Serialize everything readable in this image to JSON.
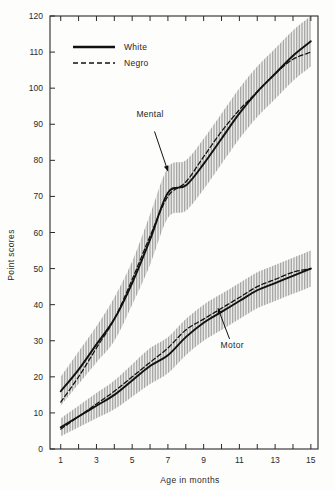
{
  "chart_data": {
    "type": "line",
    "title": "",
    "xlabel": "Age in months",
    "ylabel": "Point scores",
    "xlim": [
      0.4,
      15.4
    ],
    "ylim": [
      0,
      120
    ],
    "ytick_values": [
      0,
      10,
      20,
      30,
      40,
      50,
      60,
      70,
      80,
      90,
      100,
      110,
      120
    ],
    "ytick_labels": [
      "0",
      "10",
      "20",
      "30",
      "40",
      "50",
      "60",
      "70",
      "80",
      "90",
      "100",
      "110",
      "120"
    ],
    "xtick_values": [
      1,
      2,
      3,
      4,
      5,
      6,
      7,
      8,
      9,
      10,
      11,
      12,
      13,
      14,
      15
    ],
    "xtick_labels": [
      "1",
      "",
      "3",
      "",
      "5",
      "",
      "7",
      "",
      "9",
      "",
      "11",
      "",
      "13",
      "",
      "15"
    ],
    "grid": false,
    "legend_position": "upper-left-inside",
    "legend": [
      {
        "name": "White",
        "style": "solid"
      },
      {
        "name": "Negro",
        "style": "dashed"
      }
    ],
    "annotations": [
      {
        "text": "Mental",
        "x": 6.0,
        "y": 92
      },
      {
        "text": "Motor",
        "x": 10.6,
        "y": 28
      }
    ],
    "x": [
      1,
      2,
      3,
      4,
      5,
      6,
      7,
      8,
      9,
      10,
      11,
      12,
      13,
      14,
      15
    ],
    "series": [
      {
        "name": "Mental White",
        "group": "Mental",
        "style": "solid",
        "values": [
          16,
          22,
          29,
          36,
          46,
          58,
          71,
          73,
          79,
          86,
          93,
          99,
          104,
          109,
          113
        ],
        "band_low": [
          12,
          18,
          24,
          30,
          40,
          51,
          64,
          66,
          72,
          79,
          86,
          92,
          97,
          102,
          106
        ],
        "band_high": [
          20,
          27,
          34,
          42,
          52,
          65,
          78,
          80,
          86,
          93,
          100,
          106,
          111,
          116,
          120
        ]
      },
      {
        "name": "Mental Negro",
        "group": "Mental",
        "style": "dashed",
        "values": [
          13,
          20,
          28,
          36,
          47,
          59,
          70,
          74,
          81,
          88,
          94,
          99,
          104,
          108,
          110
        ]
      },
      {
        "name": "Motor White",
        "group": "Motor",
        "style": "solid",
        "values": [
          6,
          9,
          12,
          15,
          19,
          23,
          26,
          31,
          35,
          38,
          41,
          44,
          46,
          48,
          50
        ],
        "band_low": [
          3.5,
          6,
          8.5,
          11,
          14.5,
          18,
          21,
          26,
          30,
          33,
          36,
          39,
          41,
          43,
          45
        ],
        "band_high": [
          8.5,
          12,
          15.5,
          19,
          23.5,
          28,
          31,
          36,
          40,
          43,
          46,
          49,
          51,
          53,
          55
        ]
      },
      {
        "name": "Motor Negro",
        "group": "Motor",
        "style": "dashed",
        "values": [
          5.5,
          9,
          12.5,
          16,
          20,
          24,
          28,
          33,
          36,
          39,
          42,
          45,
          47,
          49,
          50
        ]
      }
    ],
    "colors": {
      "line": "#111111",
      "band": "#b9b9b9",
      "axis": "#2a2a2a",
      "background": "#fdfdfc"
    }
  }
}
